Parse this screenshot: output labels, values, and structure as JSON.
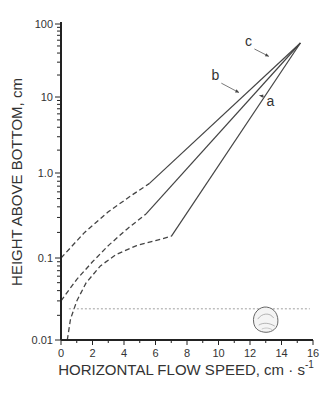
{
  "chart_data": {
    "type": "line",
    "title": "",
    "xlabel": "HORIZONTAL FLOW SPEED, cm · s",
    "xlabel_superscript": "-1",
    "ylabel": "HEIGHT ABOVE BOTTOM, cm",
    "xlim": [
      0,
      16
    ],
    "ylim": [
      0.01,
      100
    ],
    "yscale": "log",
    "grid": false,
    "x_ticks": [
      0,
      2,
      4,
      6,
      8,
      10,
      12,
      14,
      16
    ],
    "x_tick_labels": [
      "0",
      "2",
      "4",
      "6",
      "8",
      "10",
      "12",
      "14",
      "16"
    ],
    "y_ticks": [
      0.01,
      0.1,
      1.0,
      10,
      100
    ],
    "y_tick_labels": [
      "0.01",
      "0.1",
      "1.0",
      "10",
      "100"
    ],
    "series": [
      {
        "name": "c",
        "solid": [
          [
            5.6,
            0.75
          ],
          [
            15.2,
            55
          ]
        ],
        "dashed": [
          [
            0,
            0.1
          ],
          [
            1.5,
            0.2
          ],
          [
            3.0,
            0.35
          ],
          [
            4.5,
            0.55
          ],
          [
            5.6,
            0.75
          ]
        ],
        "label_pos": [
          11.9,
          50
        ],
        "arrow_to": [
          13.2,
          36
        ]
      },
      {
        "name": "b",
        "solid": [
          [
            5.4,
            0.33
          ],
          [
            15.2,
            55
          ]
        ],
        "dashed": [
          [
            0,
            0.03
          ],
          [
            1.0,
            0.055
          ],
          [
            2.0,
            0.09
          ],
          [
            3.0,
            0.14
          ],
          [
            4.2,
            0.22
          ],
          [
            5.4,
            0.33
          ]
        ],
        "label_pos": [
          9.8,
          17
        ],
        "arrow_to": [
          11.3,
          11.5
        ]
      },
      {
        "name": "a",
        "solid": [
          [
            7.0,
            0.18
          ],
          [
            15.2,
            55
          ]
        ],
        "dashed": [
          [
            0.4,
            0.01
          ],
          [
            0.6,
            0.018
          ],
          [
            1.0,
            0.03
          ],
          [
            1.6,
            0.05
          ],
          [
            2.5,
            0.08
          ],
          [
            3.5,
            0.11
          ],
          [
            4.8,
            0.14
          ],
          [
            6.0,
            0.16
          ],
          [
            7.0,
            0.18
          ]
        ],
        "label_pos": [
          13.3,
          7.5
        ],
        "arrow_to": [
          12.6,
          10.5
        ]
      }
    ],
    "annotations": [
      {
        "type": "dotted_hline",
        "y": 0.024,
        "x_range": [
          0.5,
          15.8
        ],
        "note": "approximate organism height"
      },
      {
        "type": "icon",
        "name": "shell-organism",
        "x": 13.0,
        "y": 0.017
      }
    ]
  }
}
